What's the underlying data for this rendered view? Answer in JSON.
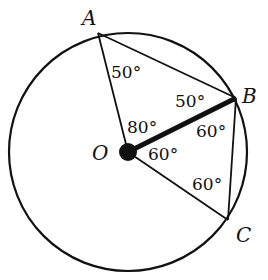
{
  "diagram": {
    "points": {
      "A": {
        "label": "A"
      },
      "B": {
        "label": "B"
      },
      "C": {
        "label": "C"
      },
      "O": {
        "label": "O"
      }
    },
    "angles": {
      "OAB": "50°",
      "OBA": "50°",
      "AOB": "80°",
      "OBC": "60°",
      "BOC": "60°",
      "OCB": "60°"
    },
    "colors": {
      "stroke": "#111111",
      "background": "#ffffff"
    }
  }
}
